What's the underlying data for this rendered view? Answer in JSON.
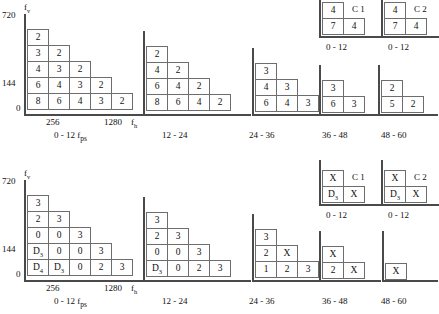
{
  "figure": {
    "axis": {
      "y_label": "f",
      "y_label_sub": "v",
      "x_label": "f",
      "x_label_sub": "h",
      "y_ticks": [
        "720",
        "144",
        "0"
      ],
      "x_ticks": [
        "256",
        "1280"
      ]
    }
  },
  "chart_data": {
    "type": "heatmap",
    "xlabel": "f_h",
    "ylabel": "f_v",
    "x_ticks": [
      "256",
      "1280"
    ],
    "y_ticks": [
      "0",
      "144",
      "720"
    ],
    "grid": false,
    "legend": "none",
    "note": "Each panel is a staircase of cells; rows listed top-to-bottom, each row left-to-right.",
    "panels": [
      {
        "id": "top-0-12",
        "row": "top",
        "caption": "0 - 12 f",
        "caption_sub": "ps",
        "has_axes": true,
        "rows": [
          [
            "2"
          ],
          [
            "3",
            "2"
          ],
          [
            "4",
            "3",
            "2"
          ],
          [
            "6",
            "4",
            "3",
            "2"
          ],
          [
            "8",
            "6",
            "4",
            "3",
            "2"
          ]
        ]
      },
      {
        "id": "top-12-24",
        "row": "top",
        "caption": "12 - 24",
        "has_axes": true,
        "rows": [
          [
            "2"
          ],
          [
            "4",
            "2"
          ],
          [
            "6",
            "4",
            "2"
          ],
          [
            "8",
            "6",
            "4",
            "2"
          ]
        ]
      },
      {
        "id": "top-24-36",
        "row": "top",
        "caption": "24 - 36",
        "has_axes": true,
        "rows": [
          [
            "3"
          ],
          [
            "4",
            "3"
          ],
          [
            "6",
            "4",
            "3"
          ]
        ]
      },
      {
        "id": "top-36-48",
        "row": "top",
        "caption": "36 - 48",
        "has_axes": true,
        "rows": [
          [
            "3"
          ],
          [
            "6",
            "3"
          ]
        ]
      },
      {
        "id": "top-48-60",
        "row": "top",
        "caption": "48 - 60",
        "has_axes": true,
        "rows": [
          [
            "2"
          ],
          [
            "5",
            "2"
          ]
        ]
      },
      {
        "id": "top-c1",
        "row": "top",
        "caption": "0 - 12",
        "inset_label": "C 1",
        "has_axes": true,
        "rows": [
          [
            "4"
          ],
          [
            "7",
            "4"
          ]
        ]
      },
      {
        "id": "top-c2",
        "row": "top",
        "caption": "0 - 12",
        "inset_label": "C 2",
        "has_axes": true,
        "rows": [
          [
            "4"
          ],
          [
            "7",
            "4"
          ]
        ]
      },
      {
        "id": "bottom-0-12",
        "row": "bottom",
        "caption": "0 - 12 f",
        "caption_sub": "ps",
        "has_axes": true,
        "rows": [
          [
            "3"
          ],
          [
            "2",
            "3"
          ],
          [
            "0",
            "0",
            "3"
          ],
          [
            "D3",
            "0",
            "0",
            "3"
          ],
          [
            "D4",
            "D3",
            "0",
            "2",
            "3"
          ]
        ]
      },
      {
        "id": "bottom-12-24",
        "row": "bottom",
        "caption": "12 - 24",
        "has_axes": true,
        "rows": [
          [
            "3"
          ],
          [
            "2",
            "3"
          ],
          [
            "0",
            "0",
            "3"
          ],
          [
            "D3",
            "0",
            "2",
            "3"
          ]
        ]
      },
      {
        "id": "bottom-24-36",
        "row": "bottom",
        "caption": "24 - 36",
        "has_axes": true,
        "rows": [
          [
            "3"
          ],
          [
            "2",
            "X"
          ],
          [
            "1",
            "2",
            "3"
          ]
        ]
      },
      {
        "id": "bottom-36-48",
        "row": "bottom",
        "caption": "36 - 48",
        "has_axes": true,
        "rows": [
          [
            "X"
          ],
          [
            "2",
            "X"
          ]
        ]
      },
      {
        "id": "bottom-48-60",
        "row": "bottom",
        "caption": "48 - 60",
        "has_axes": true,
        "rows": [
          [
            "X"
          ]
        ]
      },
      {
        "id": "bottom-c1",
        "row": "bottom",
        "caption": "0 - 12",
        "inset_label": "C 1",
        "has_axes": true,
        "rows": [
          [
            "X"
          ],
          [
            "D3",
            "X"
          ]
        ]
      },
      {
        "id": "bottom-c2",
        "row": "bottom",
        "caption": "0 - 12",
        "inset_label": "C 2",
        "has_axes": true,
        "rows": [
          [
            "X"
          ],
          [
            "D3",
            "X"
          ]
        ]
      }
    ]
  }
}
